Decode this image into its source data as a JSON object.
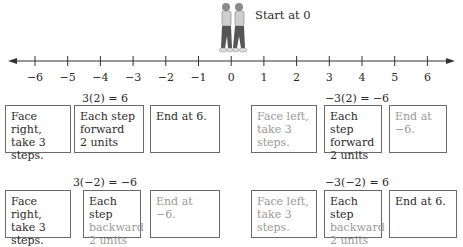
{
  "figure": {
    "label": "Start at 0",
    "icon": "two-walking-figures-back-to-back"
  },
  "number_line": {
    "ticks": [
      "−6",
      "−5",
      "−4",
      "−3",
      "−2",
      "−1",
      "0",
      "1",
      "2",
      "3",
      "4",
      "5",
      "6"
    ],
    "arrows": "both-ends"
  },
  "panels": [
    {
      "equation": "3(2) = 6",
      "boxes": [
        {
          "lines": [
            "Face right,",
            "take 3 steps."
          ],
          "style": "dark"
        },
        {
          "lines": [
            "Each step",
            "forward",
            "2 units"
          ],
          "style": "dark"
        },
        {
          "lines": [
            "End at 6."
          ],
          "style": "dark"
        }
      ]
    },
    {
      "equation": "−3(2) = −6",
      "boxes": [
        {
          "lines": [
            "Face left,",
            "take 3 steps."
          ],
          "style": "dim"
        },
        {
          "lines": [
            "Each step",
            "forward",
            "2 units"
          ],
          "style": "dark"
        },
        {
          "lines": [
            "End at −6."
          ],
          "style": "dim"
        }
      ]
    },
    {
      "equation": "3(−2) = −6",
      "boxes": [
        {
          "lines": [
            "Face right,",
            "take 3 steps."
          ],
          "style": "dark"
        },
        {
          "lines": [
            "Each step",
            "backward",
            "2 units"
          ],
          "style": "mixed"
        },
        {
          "lines": [
            "End at −6."
          ],
          "style": "dim"
        }
      ]
    },
    {
      "equation": "−3(−2) = 6",
      "boxes": [
        {
          "lines": [
            "Face left,",
            "take 3 steps."
          ],
          "style": "dim"
        },
        {
          "lines": [
            "Each step",
            "backward",
            "2 units"
          ],
          "style": "mixed"
        },
        {
          "lines": [
            "End at 6."
          ],
          "style": "dark"
        }
      ]
    }
  ],
  "colors": {
    "text_dark": "#2a2a2a",
    "text_dim": "#9a9a9a",
    "border": "#6a6a6a",
    "line": "#333333"
  }
}
